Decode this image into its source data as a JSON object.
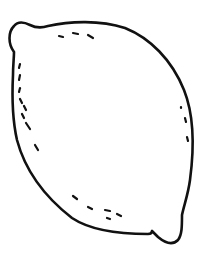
{
  "image": {
    "subject": "lemon line drawing",
    "background": "#ffffff",
    "stroke": "#111111"
  }
}
